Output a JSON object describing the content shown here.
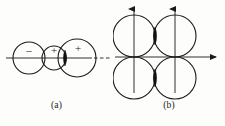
{
  "figure": {
    "type": "line-diagram",
    "background_color": "#fdfdfc",
    "stroke_color": "#1a1a1a",
    "fill_color": "#111111",
    "panels": [
      {
        "id": "a",
        "caption": "(a)",
        "description": "Three mutually tangent circles of increasing radius on a horizontal axis, labelled minus, plus, plus, with a filled lens at the overlap of the second and third circles and a dashed axis continuation to the right",
        "axis": {
          "orientation": "horizontal",
          "style": "solid-with-dashed-extension",
          "y": 58,
          "x_start": 6,
          "x_end": 92,
          "dash_start": 94,
          "dash_end": 110
        },
        "circles": [
          {
            "index": 1,
            "cx": 29,
            "cy": 58,
            "r": 16,
            "sign": "–",
            "sign_label": "minus"
          },
          {
            "index": 2,
            "cx": 54,
            "cy": 58,
            "r": 12,
            "sign": "+",
            "sign_label": "plus"
          },
          {
            "index": 3,
            "cx": 77,
            "cy": 58,
            "r": 19,
            "sign": "+",
            "sign_label": "plus"
          }
        ],
        "lens": {
          "cx": 65,
          "cy": 58,
          "rx": 3.0,
          "ry": 8.0,
          "label": "filled-lens-overlap"
        }
      },
      {
        "id": "b",
        "caption": "(b)",
        "description": "Four equal circles in a two by two arrangement centred on a pair of axes; two vertical arrows point up through the left and right columns and one horizontal arrow points right along the mid line, with filled lenses where vertically adjacent circles overlap",
        "axes": [
          {
            "name": "vertical-left",
            "orientation": "vertical",
            "x": 21,
            "y_top": 7,
            "y_bottom": 93,
            "arrow": "up"
          },
          {
            "name": "vertical-right",
            "orientation": "vertical",
            "x": 62,
            "y_top": 7,
            "y_bottom": 93,
            "arrow": "up"
          },
          {
            "name": "horizontal",
            "orientation": "horizontal",
            "y": 57,
            "x_start": 2,
            "x_end": 105,
            "arrow": "right"
          }
        ],
        "circles": [
          {
            "index": 1,
            "cx": 21,
            "cy": 36,
            "r": 21,
            "position": "top-left"
          },
          {
            "index": 2,
            "cx": 62,
            "cy": 36,
            "r": 21,
            "position": "top-right"
          },
          {
            "index": 3,
            "cx": 21,
            "cy": 78,
            "r": 21,
            "position": "bottom-left"
          },
          {
            "index": 4,
            "cx": 62,
            "cy": 78,
            "r": 21,
            "position": "bottom-right"
          }
        ],
        "lenses": [
          {
            "cx": 42,
            "cy": 36,
            "rx": 3.0,
            "ry": 9.0,
            "label": "filled-lens-top"
          },
          {
            "cx": 42,
            "cy": 78,
            "rx": 3.0,
            "ry": 9.0,
            "label": "filled-lens-bottom"
          }
        ]
      }
    ]
  }
}
